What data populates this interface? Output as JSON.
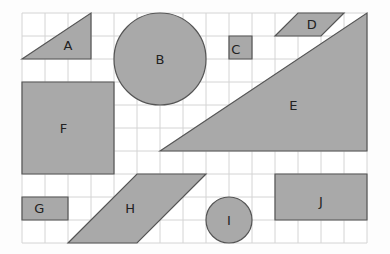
{
  "grid": {
    "cols": 15,
    "rows": 10,
    "cell": 23,
    "x0": 22,
    "y0": 13,
    "line_color": "#d4d4d4",
    "bg": "#ffffff"
  },
  "shape_fill": "#a9a9a9",
  "shape_stroke": "#555555",
  "shapes": [
    {
      "id": "A",
      "type": "polygon",
      "points": [
        [
          0,
          2
        ],
        [
          3,
          0
        ],
        [
          3,
          2
        ]
      ],
      "label_at": [
        2,
        1.4
      ]
    },
    {
      "id": "B",
      "type": "circle",
      "c": [
        6,
        2
      ],
      "r": 2,
      "label_at": [
        6,
        2
      ]
    },
    {
      "id": "C",
      "type": "polygon",
      "points": [
        [
          9,
          1
        ],
        [
          10,
          1
        ],
        [
          10,
          2
        ],
        [
          9,
          2
        ]
      ],
      "label_at": [
        9.3,
        1.6
      ]
    },
    {
      "id": "D",
      "type": "polygon",
      "points": [
        [
          12,
          0
        ],
        [
          14,
          0
        ],
        [
          13,
          1
        ],
        [
          11,
          1
        ]
      ],
      "label_at": [
        12.6,
        0.5
      ]
    },
    {
      "id": "E",
      "type": "polygon",
      "points": [
        [
          6,
          6
        ],
        [
          15,
          0
        ],
        [
          15,
          6
        ]
      ],
      "label_at": [
        11.8,
        4
      ]
    },
    {
      "id": "F",
      "type": "polygon",
      "points": [
        [
          0,
          3
        ],
        [
          4,
          3
        ],
        [
          4,
          7
        ],
        [
          0,
          7
        ]
      ],
      "label_at": [
        1.8,
        5
      ]
    },
    {
      "id": "G",
      "type": "polygon",
      "points": [
        [
          0,
          8
        ],
        [
          2,
          8
        ],
        [
          2,
          9
        ],
        [
          0,
          9
        ]
      ],
      "label_at": [
        0.75,
        8.5
      ]
    },
    {
      "id": "H",
      "type": "polygon",
      "points": [
        [
          5,
          7
        ],
        [
          8,
          7
        ],
        [
          5,
          10
        ],
        [
          2,
          10
        ]
      ],
      "label_at": [
        4.7,
        8.5
      ]
    },
    {
      "id": "I",
      "type": "circle",
      "c": [
        9,
        9
      ],
      "r": 1,
      "label_at": [
        9,
        9
      ]
    },
    {
      "id": "J",
      "type": "polygon",
      "points": [
        [
          11,
          7
        ],
        [
          15,
          7
        ],
        [
          15,
          9
        ],
        [
          11,
          9
        ]
      ],
      "label_at": [
        13,
        8.2
      ]
    }
  ]
}
